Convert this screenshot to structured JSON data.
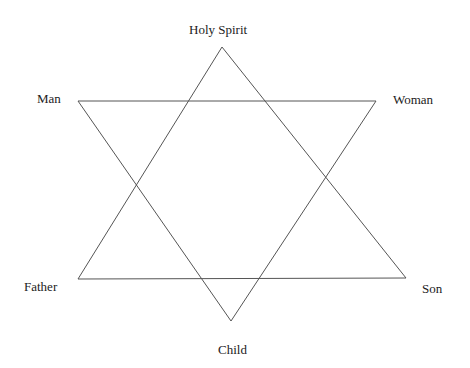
{
  "diagram": {
    "type": "hexagram",
    "stroke_color": "#555555",
    "nodes": {
      "holy_spirit": {
        "label": "Holy Spirit",
        "x": 222,
        "y": 47
      },
      "man": {
        "label": "Man",
        "x": 78,
        "y": 101
      },
      "woman": {
        "label": "Woman",
        "x": 376,
        "y": 101
      },
      "father": {
        "label": "Father",
        "x": 78,
        "y": 279
      },
      "son": {
        "label": "Son",
        "x": 406,
        "y": 278
      },
      "child": {
        "label": "Child",
        "x": 231,
        "y": 321
      }
    },
    "triangles": [
      {
        "name": "upward",
        "vertices": [
          "holy_spirit",
          "father",
          "son"
        ]
      },
      {
        "name": "downward",
        "vertices": [
          "man",
          "woman",
          "child"
        ]
      }
    ]
  }
}
